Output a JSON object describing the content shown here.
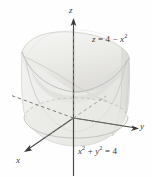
{
  "figure": {
    "kind": "3d-solid-region",
    "background_color": "#fefefe",
    "ink_color": "#3a3a3a",
    "surface_fill_light": "#f0f0ee",
    "surface_fill_mid": "#e2e2df",
    "surface_fill_dark": "#d2d2cf",
    "axes": {
      "z": {
        "label": "z",
        "direction": "up"
      },
      "y": {
        "label": "y",
        "direction": "right"
      },
      "x": {
        "label": "x",
        "direction": "down-left"
      }
    },
    "annotations": {
      "top_surface": {
        "lhs": "z",
        "eq": "=",
        "rhs_first": "4",
        "minus": "−",
        "rhs_var": "x",
        "rhs_exp": "2",
        "full": "z = 4 − x²"
      },
      "base_curve": {
        "var1": "x",
        "exp1": "2",
        "plus": "+",
        "var2": "y",
        "exp2": "2",
        "eq": "=",
        "value": "4",
        "full": "x² + y² = 4"
      }
    }
  }
}
